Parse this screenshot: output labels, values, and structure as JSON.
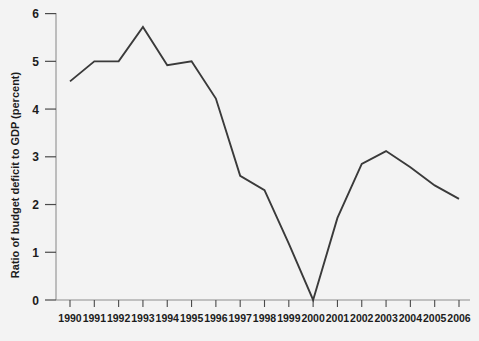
{
  "chart_data": {
    "type": "line",
    "title": "",
    "xlabel": "",
    "ylabel": "Ratio of budget deficit to GDP (percent)",
    "x": [
      1990,
      1991,
      1992,
      1993,
      1994,
      1995,
      1996,
      1997,
      1998,
      1999,
      2000,
      2001,
      2002,
      2003,
      2004,
      2005,
      2006
    ],
    "categories": [
      "1990",
      "1991",
      "1992",
      "1993",
      "1994",
      "1995",
      "1996",
      "1997",
      "1998",
      "1999",
      "2000",
      "2001",
      "2002",
      "2003",
      "2004",
      "2005",
      "2006"
    ],
    "values": [
      4.58,
      5.0,
      5.0,
      5.72,
      4.92,
      5.0,
      4.22,
      2.6,
      2.3,
      1.18,
      0.0,
      1.72,
      2.85,
      3.12,
      2.78,
      2.4,
      2.12
    ],
    "series": [
      {
        "name": "Ratio of budget deficit to GDP (percent)",
        "values": [
          4.58,
          5.0,
          5.0,
          5.72,
          4.92,
          5.0,
          4.22,
          2.6,
          2.3,
          1.18,
          0.0,
          1.72,
          2.85,
          3.12,
          2.78,
          2.4,
          2.12
        ]
      }
    ],
    "ylim": [
      0,
      6
    ],
    "xlim": [
      1990,
      2006
    ],
    "ytick_labels": [
      "0",
      "1",
      "2",
      "3",
      "4",
      "5",
      "6"
    ],
    "ytick_values": [
      0,
      1,
      2,
      3,
      4,
      5,
      6
    ],
    "xtick_labels": [
      "1990",
      "1991",
      "1992",
      "1993",
      "1994",
      "1995",
      "1996",
      "1997",
      "1998",
      "1999",
      "2000",
      "2001",
      "2002",
      "2003",
      "2004",
      "2005",
      "2006"
    ],
    "grid": false,
    "legend": "none",
    "line_color": "#3a3a3a",
    "background_color": "#f3f3f3",
    "axis_color": "#8e8e8e",
    "text_color": "#1c1c1c"
  }
}
